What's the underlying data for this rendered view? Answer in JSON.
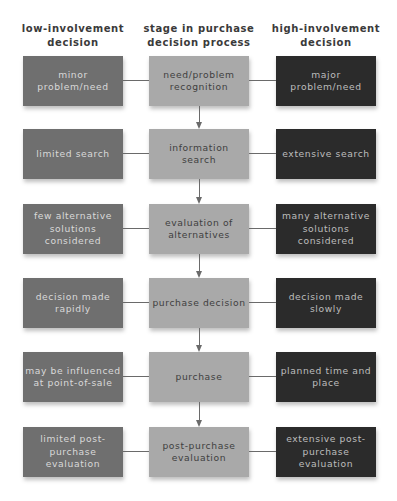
{
  "headers": {
    "low": "low-involvement decision",
    "stage": "stage in purchase decision process",
    "high": "high-involvement decision"
  },
  "rows": [
    {
      "low": "minor problem/need",
      "stage": "need/problem recognition",
      "high": "major problem/need"
    },
    {
      "low": "limited search",
      "stage": "information search",
      "high": "extensive search"
    },
    {
      "low": "few alternative solutions considered",
      "stage": "evaluation of alternatives",
      "high": "many alternative solutions considered"
    },
    {
      "low": "decision made rapidly",
      "stage": "purchase decision",
      "high": "decision made slowly"
    },
    {
      "low": "may be influenced at point-of-sale",
      "stage": "purchase",
      "high": "planned time and place"
    },
    {
      "low": "limited post-purchase evaluation",
      "stage": "post-purchase evaluation",
      "high": "extensive post-purchase evaluation"
    }
  ],
  "colors": {
    "low_box": "#6f6f6f",
    "stage_box": "#a9a9a9",
    "high_box": "#2b2b2b",
    "connector": "#6a6a6a"
  }
}
